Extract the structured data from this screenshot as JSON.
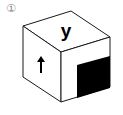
{
  "figure": {
    "option_label": "①",
    "top_face": {
      "text": "y"
    },
    "left_face": {
      "symbol": "up-arrow",
      "glyph": "↑"
    },
    "right_face": {
      "symbol": "black-square",
      "fill": "#000000"
    },
    "colors": {
      "stroke": "#1a1a1a",
      "face": "#ffffff",
      "label": "#8a8a8a"
    }
  }
}
